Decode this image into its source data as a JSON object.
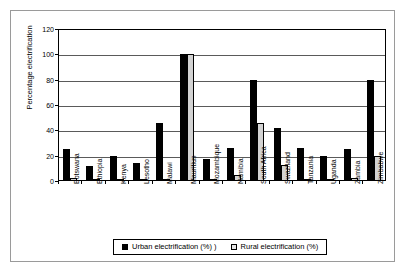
{
  "chart_data": {
    "type": "bar",
    "title": "",
    "xlabel": "",
    "ylabel": "Percentage electrification",
    "ylim": [
      0,
      120
    ],
    "ytick_values": [
      0,
      20,
      40,
      60,
      80,
      100,
      120
    ],
    "ytick_labels": [
      "0",
      "20",
      "40",
      "60",
      "80",
      "100",
      "120"
    ],
    "grid": true,
    "legend_position": "bottom",
    "categories": [
      "Botswana",
      "Ethiopia",
      "Kenya",
      "Lesotho",
      "Malawi",
      "Mauritius",
      "Mozambique",
      "Namibia",
      "South Africa",
      "Swaziland",
      "Tanzania",
      "Uganda",
      "Zambia",
      "Zimbabwe"
    ],
    "series": [
      {
        "name": "Urban electrification (%) )",
        "color": "#000000",
        "values": [
          25,
          12,
          20,
          14,
          46,
          100,
          17,
          26,
          80,
          42,
          26,
          20,
          25,
          80
        ]
      },
      {
        "name": "Rural electrification (%)",
        "color": "#d2d2d2",
        "values": [
          2,
          0.3,
          1.5,
          1.5,
          0.5,
          100,
          1,
          5,
          46,
          12.5,
          1,
          1,
          2,
          20
        ]
      }
    ]
  },
  "legend": {
    "items": [
      {
        "label": "Urban electrification (%) )",
        "swatch": "urban"
      },
      {
        "label": "Rural electrification (%)",
        "swatch": "rural"
      }
    ]
  }
}
